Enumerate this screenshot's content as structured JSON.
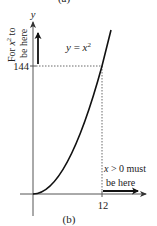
{
  "figure": {
    "top_caption": "(a)",
    "bottom_caption": "(b)",
    "y_axis_label": "y",
    "curve_label": "y = x²",
    "curve_label_parts": {
      "lhs": "y",
      "eq": " = ",
      "base": "x",
      "exp": "2"
    },
    "y_tick_label": "144",
    "x_tick_label": "12",
    "y_annotation_line1": "For x² to",
    "y_annotation_line1_parts": {
      "pre": "For ",
      "base": "x",
      "exp": "2",
      "post": " to"
    },
    "y_annotation_line2": "be here",
    "x_annotation_line1": "x > 0 must",
    "x_annotation_line1_parts": {
      "var": "x",
      "rest": " > 0 must"
    },
    "x_annotation_line2": "be here",
    "colors": {
      "axis": "#555555",
      "curve": "#111111",
      "dashed": "#444444",
      "text": "#222222",
      "background": "#ffffff"
    }
  }
}
